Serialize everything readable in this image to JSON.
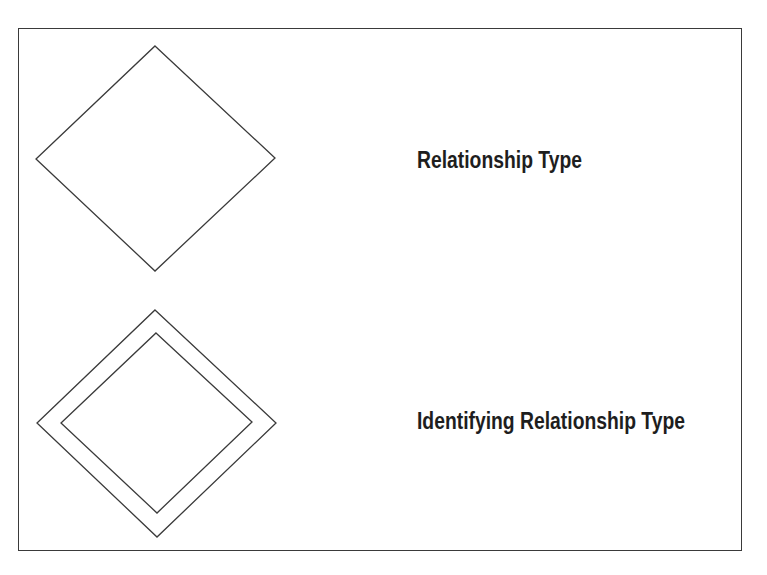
{
  "diagram": {
    "type": "ER notation legend",
    "items": [
      {
        "shape": "diamond",
        "label": "Relationship Type"
      },
      {
        "shape": "double-diamond",
        "label": "Identifying Relationship Type"
      }
    ],
    "colors": {
      "stroke": "#3a3a3a",
      "text": "#1e1e1e",
      "background": "#ffffff"
    }
  }
}
